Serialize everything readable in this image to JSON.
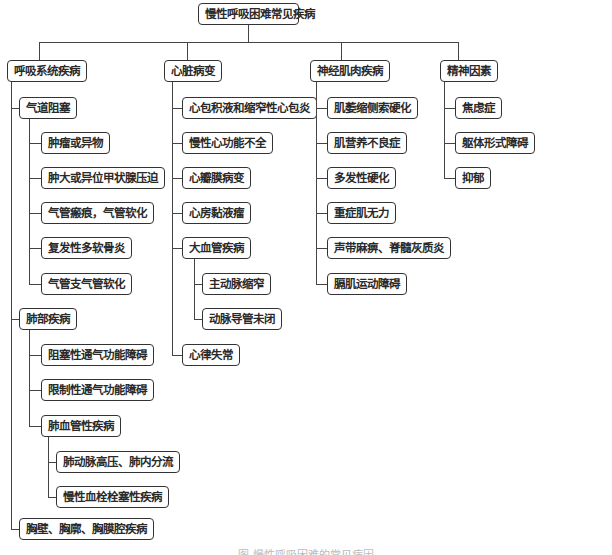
{
  "root": "慢性呼吸困难常见疾病",
  "categories": [
    {
      "label": "呼吸系统疾病",
      "groups": [
        {
          "label": "气道阻塞",
          "items": [
            "肿瘤或异物",
            "肿大或异位甲状腺压迫",
            "气管瘢痕，气管软化",
            "复发性多软骨炎",
            "气管支气管软化"
          ]
        },
        {
          "label": "肺部疾病",
          "items": [
            "阻塞性通气功能障碍",
            "限制性通气功能障碍"
          ],
          "subgroup": {
            "label": "肺血管性疾病",
            "items": [
              "肺动脉高压、肺内分流",
              "慢性血栓栓塞性疾病"
            ]
          }
        },
        {
          "label": "胸壁、胸廓、胸膜腔疾病"
        }
      ]
    },
    {
      "label": "心脏病变",
      "items": [
        "心包积液和缩窄性心包炎",
        "慢性心功能不全",
        "心瓣膜病变",
        "心房黏液瘤"
      ],
      "subgroup": {
        "label": "大血管疾病",
        "items": [
          "主动脉缩窄",
          "动脉导管未闭"
        ]
      },
      "last": "心律失常"
    },
    {
      "label": "神经肌肉疾病",
      "items": [
        "肌萎缩侧索硬化",
        "肌营养不良症",
        "多发性硬化",
        "重症肌无力",
        "声带麻痹、脊髓灰质炎",
        "膈肌运动障碍"
      ]
    },
    {
      "label": "精神因素",
      "items": [
        "焦虑症",
        "躯体形式障碍",
        "抑郁"
      ]
    }
  ],
  "caption": "图 慢性呼吸困难的常见病因"
}
